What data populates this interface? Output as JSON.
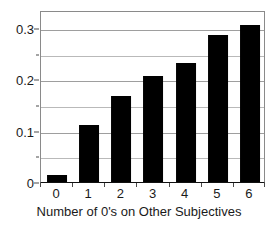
{
  "chart_data": {
    "type": "bar",
    "title": "",
    "xlabel": "Number of 0's on Other Subjectives",
    "ylabel": "",
    "categories": [
      "0",
      "1",
      "2",
      "3",
      "4",
      "5",
      "6"
    ],
    "values": [
      0.013,
      0.111,
      0.168,
      0.207,
      0.232,
      0.286,
      0.305
    ],
    "ylim": [
      0,
      0.335
    ],
    "y_tick_labels": [
      "0",
      "0.1",
      "0.2",
      "0.3"
    ],
    "y_tick_values": [
      0,
      0.1,
      0.2,
      0.3
    ],
    "y_minor_gridlines": [
      0.05,
      0.15,
      0.25
    ],
    "grid": true,
    "legend": "none",
    "bar_color": "#000000",
    "gridline_color": "#b9b9b9",
    "axis_color": "#8a8a8a",
    "background_color": "#ffffff"
  }
}
